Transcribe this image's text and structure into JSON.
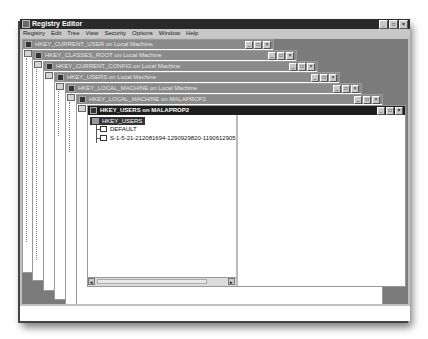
{
  "app": {
    "title": "Registry Editor",
    "controls": {
      "minimize": "_",
      "maximize": "□",
      "close": "×"
    }
  },
  "menu": [
    "Registry",
    "Edit",
    "Tree",
    "View",
    "Security",
    "Options",
    "Window",
    "Help"
  ],
  "windows": [
    {
      "title": "HKEY_CURRENT_USER on Local Machine"
    },
    {
      "title": "HKEY_CLASSES_ROOT on Local Machine"
    },
    {
      "title": "HKEY_CURRENT_CONFIG on Local Machine"
    },
    {
      "title": "HKEY_USERS on Local Machine"
    },
    {
      "title": "HKEY_LOCAL_MACHINE on Local Machine"
    },
    {
      "title": "HKEY_LOCAL_MACHINE on MALAPROP2"
    },
    {
      "title": "HKEY_USERS on MALAPROP2"
    }
  ],
  "active_window": {
    "title": "HKEY_USERS on MALAPROP2",
    "tree": {
      "root": "HKEY_USERS",
      "children": [
        "DEFAULT",
        "S-1-5-21-212081694-1290929820-1190612905"
      ]
    }
  },
  "scroll": {
    "left_arrow": "◂",
    "right_arrow": "▸"
  }
}
